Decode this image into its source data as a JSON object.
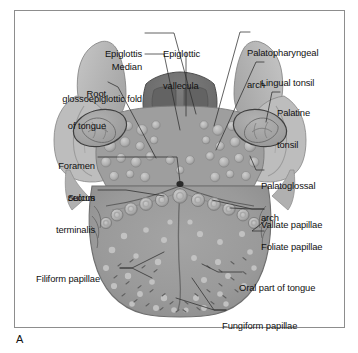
{
  "figure": {
    "panel_letter": "A",
    "frame_border_color": "#8d8d8d",
    "background_color": "#ffffff"
  },
  "palette": {
    "tongue_body": "#9a9a9a",
    "tongue_body_dark": "#8e8e8e",
    "arch_light": "#bdbdbd",
    "arch_mid": "#ababab",
    "epiglottis_dark": "#6f6f6f",
    "epiglottis_darker": "#5e5e5e",
    "tonsil_fill": "#a5a5a5",
    "papilla_light": "#c9c9c9",
    "papilla_ring": "#8a8a8a",
    "outline": "#4a4a4a",
    "leader_line": "#2e2e2e",
    "foramen_cecum": "#2a2a2a",
    "text": "#111111"
  },
  "labels": [
    {
      "id": "epiglottis",
      "text": "Epiglottis",
      "side": "right-aligned",
      "x": 142,
      "y": 28,
      "lines": [
        "Epiglottis"
      ]
    },
    {
      "id": "median-glossoepiglottic-fold",
      "text": "Median glossoepiglottic fold",
      "side": "right-aligned",
      "x": 142,
      "y": 43,
      "lines": [
        "Median",
        "glossoepiglottic fold"
      ]
    },
    {
      "id": "root-of-tongue",
      "text": "Root of tongue",
      "side": "right-aligned",
      "x": 106,
      "y": 71,
      "lines": [
        "Root",
        "of tongue"
      ]
    },
    {
      "id": "foramen-cecum",
      "text": "Foramen cecum",
      "side": "right-aligned",
      "x": 95,
      "y": 142,
      "lines": [
        "Foramen",
        "cecum"
      ]
    },
    {
      "id": "sulcus-terminalis",
      "text": "Sulcus terminalis",
      "side": "right-aligned",
      "x": 95,
      "y": 173,
      "lines": [
        "Sulcus",
        "terminalis"
      ]
    },
    {
      "id": "filiform-papillae",
      "text": "Filiform papillae",
      "side": "right-aligned",
      "x": 100,
      "y": 258,
      "lines": [
        "Filiform papillae"
      ]
    },
    {
      "id": "epiglottic-vallecula",
      "text": "Epiglottic vallecula",
      "side": "left-aligned",
      "x": 163,
      "y": 28,
      "lines": [
        "Epiglottic",
        "vallecula"
      ]
    },
    {
      "id": "palatopharyngeal-arch",
      "text": "Palatopharyngeal arch",
      "side": "left-aligned",
      "x": 251,
      "y": 28,
      "lines": [
        "Palatopharyngeal",
        "arch"
      ]
    },
    {
      "id": "lingual-tonsil",
      "text": "Lingual tonsil",
      "side": "left-aligned",
      "x": 265,
      "y": 58,
      "lines": [
        "Lingual tonsil"
      ]
    },
    {
      "id": "palatine-tonsil",
      "text": "Palatine tonsil",
      "side": "left-aligned",
      "x": 281,
      "y": 88,
      "lines": [
        "Palatine",
        "tonsil"
      ]
    },
    {
      "id": "palatoglossal-arch",
      "text": "Palatoglossal arch",
      "side": "left-aligned",
      "x": 265,
      "y": 162,
      "lines": [
        "Palatoglossal",
        "arch"
      ]
    },
    {
      "id": "vallate-papillae",
      "text": "Vallate papillae",
      "side": "left-aligned",
      "x": 265,
      "y": 199,
      "lines": [
        "Vallate papillae"
      ]
    },
    {
      "id": "foliate-papillae",
      "text": "Foliate papillae",
      "side": "left-aligned",
      "x": 265,
      "y": 221,
      "lines": [
        "Foliate papillae"
      ]
    },
    {
      "id": "oral-part-of-tongue",
      "text": "Oral part of tongue",
      "side": "left-aligned",
      "x": 243,
      "y": 262,
      "lines": [
        "Oral part of tongue"
      ]
    },
    {
      "id": "fungiform-papillae",
      "text": "Fungiform papillae",
      "side": "left-aligned",
      "x": 226,
      "y": 300,
      "lines": [
        "Fungiform papillae"
      ]
    }
  ]
}
